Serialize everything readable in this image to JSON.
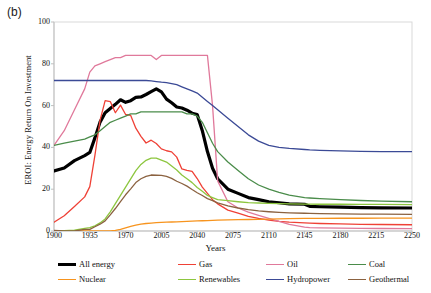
{
  "panel_label": "(b)",
  "chart_data": {
    "type": "line",
    "title": "",
    "xlabel": "Years",
    "ylabel": "EROI: Energy Return On Investment",
    "xlim": [
      1900,
      2250
    ],
    "ylim": [
      0,
      100
    ],
    "xticks": [
      1900,
      1935,
      1970,
      2005,
      2040,
      2075,
      2110,
      2145,
      2180,
      2215,
      2250
    ],
    "yticks": [
      0,
      20,
      40,
      60,
      80,
      100
    ],
    "grid": false,
    "legend_position": "below-axes",
    "x": [
      1900,
      1910,
      1920,
      1930,
      1935,
      1940,
      1945,
      1950,
      1955,
      1960,
      1965,
      1970,
      1975,
      1980,
      1985,
      1990,
      1995,
      2000,
      2005,
      2010,
      2015,
      2020,
      2025,
      2030,
      2035,
      2040,
      2045,
      2050,
      2055,
      2060,
      2070,
      2080,
      2090,
      2100,
      2110,
      2120,
      2130,
      2145,
      2150,
      2160,
      2180,
      2200,
      2220,
      2250
    ],
    "series": [
      {
        "name": "All energy",
        "color": "#000000",
        "width": 3.2,
        "values": [
          28,
          31,
          33,
          36,
          38,
          44,
          52,
          57,
          58,
          61,
          62,
          62,
          63,
          64,
          65,
          66,
          67,
          68,
          66,
          64,
          62,
          60,
          59,
          58,
          57,
          55,
          48,
          38,
          30,
          25,
          20,
          18,
          16,
          15,
          14,
          13.5,
          13,
          12.8,
          11.8,
          11.6,
          11.4,
          11.2,
          11.1,
          11
        ]
      },
      {
        "name": "Gas",
        "color": "#ef4136",
        "width": 1.3,
        "values": [
          5,
          7,
          11,
          17,
          22,
          36,
          53,
          63,
          62,
          57,
          61,
          57,
          54,
          50,
          45,
          43,
          42,
          41,
          40,
          39,
          37,
          34,
          31,
          29,
          27,
          24,
          21,
          18,
          15,
          13,
          10,
          8.5,
          7,
          6,
          5.2,
          4.6,
          4.2,
          3.9,
          3.8,
          3.6,
          3.4,
          3.2,
          3.1,
          3.0
        ]
      },
      {
        "name": "Oil",
        "color": "#e0799b",
        "width": 1.3,
        "values": [
          41,
          48,
          58,
          68,
          76,
          79,
          80,
          81,
          82,
          83,
          83,
          84,
          84,
          84,
          84,
          84,
          84,
          82,
          84,
          84,
          84,
          84,
          84,
          84,
          84,
          84,
          84,
          84,
          60,
          24,
          14,
          11,
          9,
          7.5,
          6,
          4.6,
          3.2,
          1.9,
          1.6,
          1.5,
          1.4,
          1.3,
          1.2,
          1.1
        ]
      },
      {
        "name": "Coal",
        "color": "#4a8c4a",
        "width": 1.3,
        "values": [
          41,
          42,
          43,
          44,
          45,
          46,
          48,
          50,
          52,
          53,
          54,
          55,
          56,
          56,
          57,
          57,
          57,
          57,
          57,
          57,
          57,
          57,
          57,
          56,
          56,
          55,
          52,
          47,
          42,
          38,
          33,
          29,
          25,
          22,
          20,
          18.5,
          17.2,
          16,
          15.8,
          15.5,
          15,
          14.6,
          14.3,
          14
        ]
      },
      {
        "name": "Nuclear",
        "color": "#f7941e",
        "width": 1.3,
        "values": [
          0,
          0,
          0,
          0,
          0,
          0,
          0,
          0,
          0,
          0.3,
          0.8,
          1.5,
          2.2,
          2.8,
          3.3,
          3.6,
          3.8,
          4.0,
          4.1,
          4.2,
          4.3,
          4.4,
          4.5,
          4.6,
          4.7,
          4.8,
          4.9,
          5.0,
          5.1,
          5.2,
          5.3,
          5.4,
          5.5,
          5.6,
          5.7,
          5.8,
          5.9,
          6.0,
          6.0,
          6.0,
          6.1,
          6.1,
          6.2,
          6.2
        ]
      },
      {
        "name": "Renewables",
        "color": "#8dc63f",
        "width": 1.3,
        "values": [
          0,
          0.2,
          0.5,
          1,
          1.5,
          2.5,
          4,
          6,
          9,
          13,
          17,
          21,
          25,
          29,
          32,
          34,
          35,
          35,
          34,
          33,
          31,
          29,
          27,
          25,
          23,
          21,
          19,
          17,
          16,
          15,
          14.5,
          14,
          13.6,
          13.4,
          13.2,
          13.1,
          13,
          12.9,
          12.9,
          12.8,
          12.8,
          12.7,
          12.7,
          12.6
        ]
      },
      {
        "name": "Hydropower",
        "color": "#3b4a96",
        "width": 1.3,
        "values": [
          72,
          72,
          72,
          72,
          72,
          72,
          72,
          72,
          72,
          72,
          72,
          72,
          72,
          72,
          72,
          72,
          71.8,
          71.5,
          71.2,
          71,
          70.5,
          70,
          69,
          68,
          67,
          66,
          64,
          62,
          60,
          58,
          54,
          50,
          46,
          43,
          41,
          40,
          39.5,
          39,
          38.8,
          38.6,
          38.3,
          38.1,
          38,
          38
        ]
      },
      {
        "name": "Geothermal",
        "color": "#8b6240",
        "width": 1.3,
        "values": [
          0,
          0.1,
          0.3,
          0.7,
          1,
          1.8,
          3,
          5,
          8,
          11,
          14,
          17,
          20,
          23,
          25,
          26.5,
          27,
          27,
          26.5,
          26,
          25,
          24,
          23,
          21.5,
          20,
          18.5,
          17,
          15.5,
          14.5,
          13.5,
          12,
          11,
          10.2,
          9.6,
          9.2,
          8.9,
          8.7,
          8.5,
          8.4,
          8.3,
          8.2,
          8.1,
          8.05,
          8
        ]
      }
    ]
  },
  "legend": {
    "items": [
      {
        "label": "All energy",
        "color": "#000000",
        "thick": true
      },
      {
        "label": "Gas",
        "color": "#ef4136",
        "thick": false
      },
      {
        "label": "Oil",
        "color": "#e0799b",
        "thick": false
      },
      {
        "label": "Coal",
        "color": "#4a8c4a",
        "thick": false
      },
      {
        "label": "Nuclear",
        "color": "#f7941e",
        "thick": false
      },
      {
        "label": "Renewables",
        "color": "#8dc63f",
        "thick": false
      },
      {
        "label": "Hydropower",
        "color": "#3b4a96",
        "thick": false
      },
      {
        "label": "Geothermal",
        "color": "#8b6240",
        "thick": false
      }
    ]
  }
}
